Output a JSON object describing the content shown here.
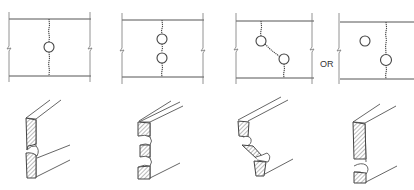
{
  "diagram": {
    "type": "technical-illustration",
    "separator_label": "OR",
    "panels": [
      {
        "id": 1,
        "top": "single hole with cracks extending up and down",
        "bottom": "section with single notch"
      },
      {
        "id": 2,
        "top": "two holes vertically aligned connected by cracks",
        "bottom": "section with two notches"
      },
      {
        "id": 3,
        "top": "two offset holes connected by diagonal crack",
        "bottom": "section with diagonal fracture"
      },
      {
        "id": 4,
        "top": "isolated hole plus hole on crack line",
        "bottom": "section with single low notch"
      }
    ]
  }
}
